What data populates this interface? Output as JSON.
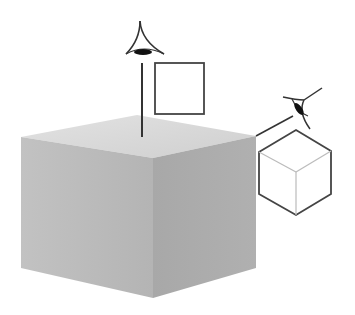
{
  "diagram": {
    "colors": {
      "background": "#ffffff",
      "line": "#333333",
      "hidden_edge": "#bbbbbb",
      "cube_top": "#d6d6d6",
      "cube_left": "#b9b9b9",
      "cube_right": "#a9a9a9"
    },
    "elements": [
      {
        "id": "solid-cube",
        "label": "shaded 3D cube"
      },
      {
        "id": "top-eye",
        "label": "viewer eye looking down"
      },
      {
        "id": "top-view-square",
        "label": "top view: square"
      },
      {
        "id": "corner-eye",
        "label": "viewer eye looking from corner"
      },
      {
        "id": "isometric-cube-outline",
        "label": "corner view: hexagon cube outline"
      }
    ]
  }
}
